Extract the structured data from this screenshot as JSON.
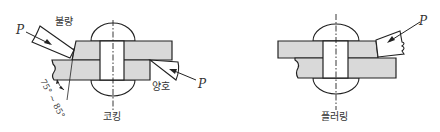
{
  "diagram": {
    "type": "rivet-joint-finishing-methods",
    "figures": [
      {
        "id": "caulking",
        "caption": "코킹",
        "labels": {
          "force_top": "P",
          "force_bottom": "P",
          "bad_tool": "불량",
          "good_tool": "양호",
          "angle_range": "75° ~ 85°"
        }
      },
      {
        "id": "fullering",
        "caption": "플러링",
        "labels": {
          "force": "P"
        }
      }
    ],
    "colors": {
      "plate_fill": "#d9d9d9",
      "line": "#222222",
      "background": "#ffffff"
    }
  }
}
